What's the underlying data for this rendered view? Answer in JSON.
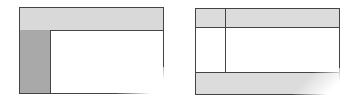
{
  "diagrams": [
    {
      "name": "layout-header-sidebar",
      "colors": {
        "header": "#d9d9d9",
        "sidebar": "#a9a9a9",
        "content": "#ffffff",
        "border": "#444444"
      },
      "regions": [
        "header",
        "sidebar",
        "content"
      ]
    },
    {
      "name": "layout-header-sidebar-footer",
      "colors": {
        "header": "#dcdcdc",
        "sidebar": "#ffffff",
        "footer": "#dcdcdc",
        "content": "#ffffff",
        "border": "#444444"
      },
      "regions": [
        "header",
        "sidebar",
        "content",
        "footer"
      ]
    }
  ]
}
